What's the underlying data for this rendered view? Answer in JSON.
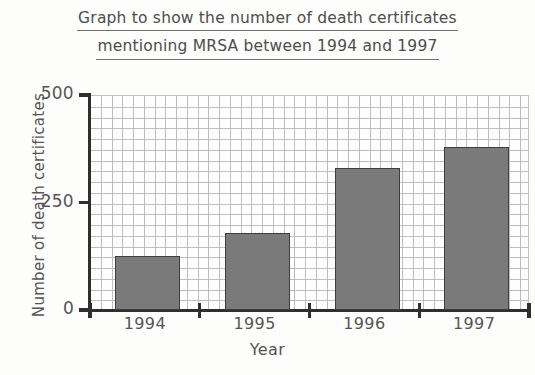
{
  "chart_data": {
    "type": "bar",
    "title": "Graph to show the number of death certificates mentioning MRSA between 1994 and 1997",
    "title_line_1": "Graph to show the number of death certificates",
    "title_line_2": "mentioning MRSA between 1994 and 1997",
    "categories": [
      "1994",
      "1995",
      "1996",
      "1997"
    ],
    "values": [
      125,
      180,
      330,
      380
    ],
    "series": [
      {
        "name": "Death certificates mentioning MRSA",
        "values": [
          125,
          180,
          330,
          380
        ]
      }
    ],
    "xlabel": "Year",
    "ylabel": "Number of death certificates",
    "ylim": [
      0,
      500
    ],
    "ytick_labels": [
      "0",
      "250",
      "500"
    ],
    "ytick_values": [
      0,
      250,
      500
    ],
    "grid": true,
    "grid_step": 25,
    "legend": "none",
    "bar_color": "#7a7a7a",
    "bar_edge_color": "#3d3d3d",
    "grid_color": "#bdbdbd",
    "axis_color": "#2f2f2f",
    "background_color": "#fdfdfc"
  }
}
